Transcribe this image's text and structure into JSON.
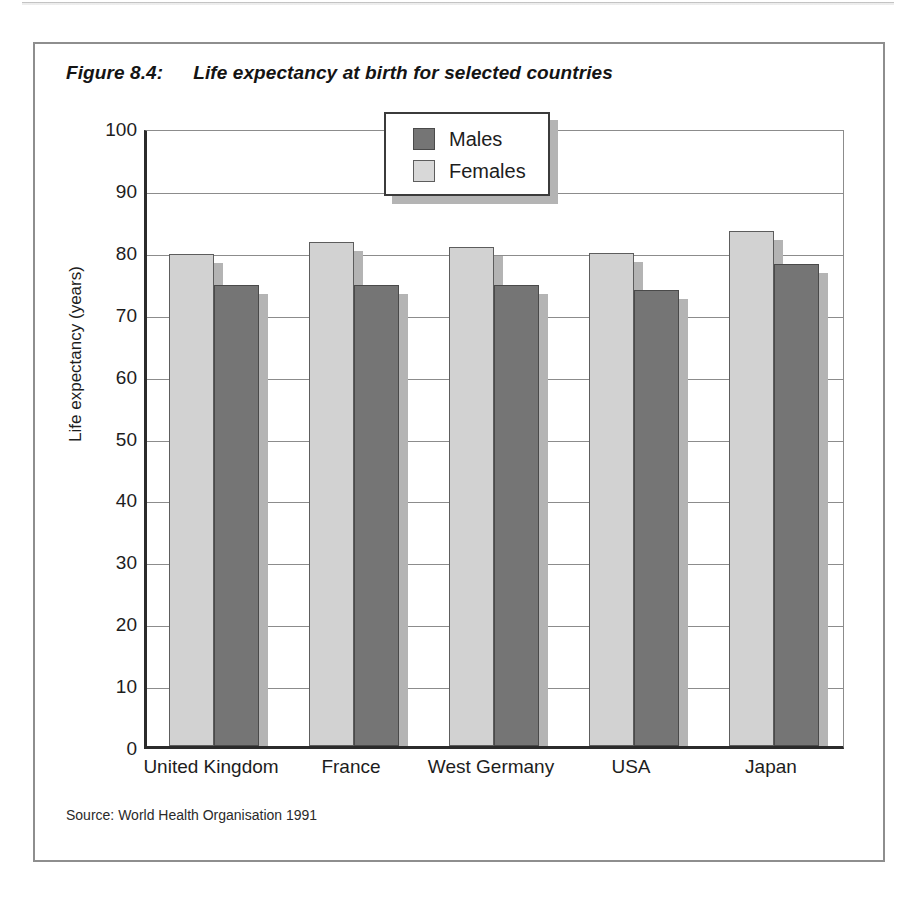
{
  "figure": {
    "number": "Figure 8.4:",
    "title": "Life expectancy at birth for selected countries",
    "source": "Source: World Health Organisation 1991"
  },
  "legend": {
    "items": [
      {
        "label": "Males",
        "color": "#757575",
        "key": "males"
      },
      {
        "label": "Females",
        "color": "#d8d8d8",
        "key": "females"
      }
    ]
  },
  "chart_data": {
    "type": "bar",
    "title": "Life expectancy at birth for selected countries",
    "xlabel": "",
    "ylabel": "Life expectancy (years)",
    "ylim": [
      0,
      100
    ],
    "ytick_step": 10,
    "yticks": [
      "100",
      "90",
      "80",
      "70",
      "60",
      "50",
      "40",
      "30",
      "20",
      "10",
      "0"
    ],
    "grid": true,
    "legend_position": "top-center",
    "categories": [
      "United Kingdom",
      "France",
      "West Germany",
      "USA",
      "Japan"
    ],
    "series": [
      {
        "name": "Females",
        "color": "#d2d2d2",
        "values": [
          79.5,
          81.5,
          80.6,
          79.7,
          83.2
        ]
      },
      {
        "name": "Males",
        "color": "#757575",
        "values": [
          74.4,
          74.4,
          74.5,
          73.7,
          77.9
        ]
      }
    ],
    "annotations": [
      "Source: World Health Organisation 1991"
    ]
  }
}
